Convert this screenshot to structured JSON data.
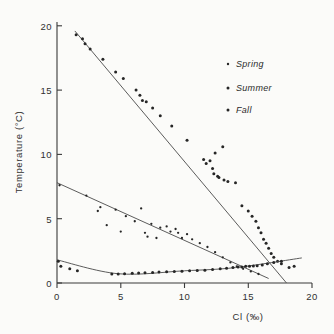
{
  "chart_data": {
    "type": "scatter",
    "title": "",
    "xlabel": "Cl  (‰)",
    "ylabel": "Temperature (°C)",
    "xlim": [
      0,
      20
    ],
    "ylim": [
      0,
      20
    ],
    "xticks": [
      0,
      5,
      10,
      15,
      20
    ],
    "yticks": [
      0,
      5,
      10,
      15,
      20
    ],
    "xticklabels": [
      "0",
      "5",
      "10",
      "15",
      "20"
    ],
    "yticklabels": [
      "0",
      "5",
      "10",
      "15",
      "20"
    ],
    "grid": false,
    "legend_position": "upper right",
    "series": [
      {
        "name": "Spring",
        "marker": "dot",
        "points": [
          [
            0.2,
            7.6
          ],
          [
            2.3,
            6.8
          ],
          [
            3.2,
            5.6
          ],
          [
            3.4,
            5.9
          ],
          [
            3.9,
            4.5
          ],
          [
            4.6,
            5.7
          ],
          [
            5.0,
            4.0
          ],
          [
            5.4,
            5.2
          ],
          [
            6.1,
            4.8
          ],
          [
            6.6,
            5.8
          ],
          [
            6.9,
            3.9
          ],
          [
            7.1,
            3.6
          ],
          [
            7.4,
            4.6
          ],
          [
            7.8,
            3.5
          ],
          [
            8.1,
            4.3
          ],
          [
            8.6,
            4.4
          ],
          [
            8.9,
            4.0
          ],
          [
            9.3,
            4.2
          ],
          [
            9.5,
            3.9
          ],
          [
            9.8,
            3.5
          ],
          [
            10.2,
            3.8
          ],
          [
            10.6,
            3.4
          ],
          [
            11.2,
            3.1
          ],
          [
            11.8,
            2.8
          ],
          [
            12.4,
            2.4
          ],
          [
            13.0,
            2.0
          ],
          [
            13.6,
            1.6
          ],
          [
            14.1,
            1.3
          ],
          [
            14.6,
            1.1
          ],
          [
            15.2,
            0.9
          ],
          [
            15.8,
            0.7
          ]
        ],
        "trend_line": [
          [
            0.0,
            7.8
          ],
          [
            16.6,
            0.35
          ]
        ]
      },
      {
        "name": "Summer",
        "marker": "dot",
        "points": [
          [
            1.5,
            19.3
          ],
          [
            2.0,
            19.0
          ],
          [
            2.2,
            18.6
          ],
          [
            2.6,
            18.2
          ],
          [
            3.6,
            17.4
          ],
          [
            4.6,
            16.4
          ],
          [
            5.2,
            15.9
          ],
          [
            6.2,
            15.0
          ],
          [
            6.5,
            14.6
          ],
          [
            6.7,
            14.2
          ],
          [
            7.0,
            14.1
          ],
          [
            7.5,
            13.6
          ],
          [
            8.1,
            13.0
          ],
          [
            9.0,
            12.2
          ],
          [
            10.2,
            11.1
          ],
          [
            11.5,
            9.6
          ],
          [
            11.7,
            9.3
          ],
          [
            12.0,
            9.5
          ],
          [
            12.2,
            8.9
          ],
          [
            12.3,
            8.5
          ],
          [
            12.4,
            10.1
          ],
          [
            12.6,
            8.3
          ],
          [
            12.7,
            8.2
          ],
          [
            13.0,
            10.6
          ],
          [
            13.1,
            8.0
          ],
          [
            13.4,
            7.9
          ],
          [
            14.0,
            7.8
          ],
          [
            14.5,
            6.0
          ],
          [
            15.0,
            5.6
          ],
          [
            15.3,
            5.2
          ],
          [
            15.6,
            4.8
          ],
          [
            15.8,
            4.3
          ],
          [
            16.0,
            3.9
          ],
          [
            16.2,
            3.4
          ],
          [
            16.4,
            3.1
          ],
          [
            16.6,
            2.7
          ],
          [
            16.8,
            2.3
          ],
          [
            17.0,
            2.0
          ],
          [
            17.3,
            1.7
          ],
          [
            17.6,
            1.5
          ],
          [
            18.2,
            1.2
          ]
        ],
        "trend_line": [
          [
            1.4,
            19.6
          ],
          [
            18.0,
            0.0
          ]
        ]
      },
      {
        "name": "Fall",
        "marker": "dot",
        "points": [
          [
            0.1,
            1.7
          ],
          [
            0.3,
            1.3
          ],
          [
            1.0,
            1.1
          ],
          [
            1.6,
            0.95
          ],
          [
            4.3,
            0.7
          ],
          [
            4.8,
            0.7
          ],
          [
            5.3,
            0.72
          ],
          [
            5.9,
            0.75
          ],
          [
            6.4,
            0.78
          ],
          [
            6.9,
            0.8
          ],
          [
            7.5,
            0.82
          ],
          [
            8.0,
            0.85
          ],
          [
            8.6,
            0.88
          ],
          [
            9.2,
            0.9
          ],
          [
            9.8,
            0.92
          ],
          [
            10.4,
            0.95
          ],
          [
            11.0,
            0.98
          ],
          [
            11.6,
            1.0
          ],
          [
            12.2,
            1.05
          ],
          [
            12.8,
            1.1
          ],
          [
            13.3,
            1.15
          ],
          [
            13.8,
            1.2
          ],
          [
            14.2,
            1.25
          ],
          [
            14.5,
            1.25
          ],
          [
            14.8,
            1.3
          ],
          [
            15.1,
            1.3
          ],
          [
            15.4,
            1.32
          ],
          [
            15.7,
            1.35
          ],
          [
            16.1,
            1.4
          ],
          [
            16.5,
            1.5
          ],
          [
            17.0,
            1.6
          ],
          [
            17.6,
            1.7
          ],
          [
            18.6,
            1.3
          ]
        ],
        "trend_line": [
          [
            0.0,
            1.8
          ],
          [
            4.8,
            0.72
          ],
          [
            10.0,
            0.95
          ],
          [
            14.0,
            1.2
          ],
          [
            19.2,
            1.95
          ]
        ]
      }
    ],
    "legend": [
      {
        "label": "Spring",
        "marker": "dot"
      },
      {
        "label": "Summer",
        "marker": "dot"
      },
      {
        "label": "Fall",
        "marker": "dot"
      }
    ]
  }
}
